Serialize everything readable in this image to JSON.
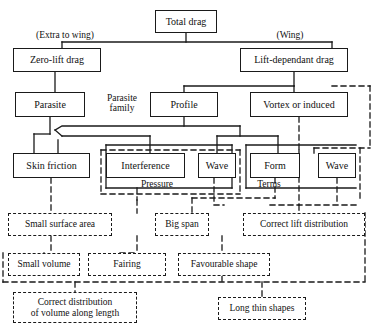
{
  "diagram": {
    "stroke_color": "#1a1a1a",
    "background": "#ffffff",
    "nodes": [
      {
        "id": "total_drag",
        "label": "Total drag",
        "style": "solid",
        "x": 155,
        "y": 10,
        "w": 62,
        "h": 23,
        "fs": 10
      },
      {
        "id": "zero_lift",
        "label": "Zero-lift drag",
        "style": "solid",
        "x": 13,
        "y": 48,
        "w": 88,
        "h": 24,
        "fs": 10
      },
      {
        "id": "lift_dep",
        "label": "Lift-dependant drag",
        "style": "solid",
        "x": 240,
        "y": 48,
        "w": 108,
        "h": 24,
        "fs": 10
      },
      {
        "id": "parasite",
        "label": "Parasite",
        "style": "solid",
        "x": 15,
        "y": 92,
        "w": 70,
        "h": 25,
        "fs": 10
      },
      {
        "id": "profile",
        "label": "Profile",
        "style": "solid",
        "x": 150,
        "y": 92,
        "w": 68,
        "h": 25,
        "fs": 10
      },
      {
        "id": "vortex",
        "label": "Vortex or induced",
        "style": "solid",
        "x": 250,
        "y": 92,
        "w": 98,
        "h": 25,
        "fs": 10
      },
      {
        "id": "skin_friction",
        "label": "Skin friction",
        "style": "solid",
        "x": 13,
        "y": 153,
        "w": 77,
        "h": 25,
        "fs": 10
      },
      {
        "id": "interference",
        "label": "Interference",
        "style": "solid",
        "x": 106,
        "y": 153,
        "w": 79,
        "h": 25,
        "fs": 10
      },
      {
        "id": "wave_left",
        "label": "Wave",
        "style": "solid",
        "x": 198,
        "y": 153,
        "w": 38,
        "h": 25,
        "fs": 10
      },
      {
        "id": "form",
        "label": "Form",
        "style": "solid",
        "x": 250,
        "y": 153,
        "w": 50,
        "h": 25,
        "fs": 10
      },
      {
        "id": "wave_right",
        "label": "Wave",
        "style": "solid",
        "x": 318,
        "y": 153,
        "w": 38,
        "h": 25,
        "fs": 10
      },
      {
        "id": "small_surf",
        "label": "Small surface area",
        "style": "dashed",
        "x": 8,
        "y": 213,
        "w": 104,
        "h": 23,
        "fs": 9.5
      },
      {
        "id": "big_span",
        "label": "Big span",
        "style": "dashed",
        "x": 155,
        "y": 213,
        "w": 54,
        "h": 23,
        "fs": 9.5
      },
      {
        "id": "corr_lift",
        "label": "Correct lift distribution",
        "style": "dashed",
        "x": 243,
        "y": 213,
        "w": 122,
        "h": 23,
        "fs": 9.5
      },
      {
        "id": "small_vol",
        "label": "Small volume",
        "style": "dashed",
        "x": 8,
        "y": 253,
        "w": 72,
        "h": 23,
        "fs": 9.5
      },
      {
        "id": "fairing",
        "label": "Fairing",
        "style": "dashed",
        "x": 88,
        "y": 253,
        "w": 78,
        "h": 23,
        "fs": 9.5
      },
      {
        "id": "fav_shape",
        "label": "Favourable shape",
        "style": "dashed",
        "x": 178,
        "y": 253,
        "w": 92,
        "h": 23,
        "fs": 9.5
      },
      {
        "id": "corr_dist",
        "label": "Correct distribution\nof volume along length",
        "style": "dashed",
        "x": 13,
        "y": 292,
        "w": 124,
        "h": 31,
        "fs": 9.5
      },
      {
        "id": "long_thin",
        "label": "Long thin shapes",
        "style": "dashed",
        "x": 218,
        "y": 297,
        "w": 88,
        "h": 23,
        "fs": 9.5
      }
    ],
    "annotations": [
      {
        "id": "extra_to_wing",
        "text": "(Extra to wing)",
        "x": 21,
        "y": 30,
        "w": 88,
        "fs": 9.5
      },
      {
        "id": "wing",
        "text": "(Wing)",
        "x": 268,
        "y": 30,
        "w": 44,
        "fs": 9.5
      },
      {
        "id": "parasite_family",
        "text": "Parasite\nfamily",
        "x": 98,
        "y": 93,
        "w": 48,
        "fs": 9.5
      },
      {
        "id": "pressure",
        "text": "Pressure",
        "x": 133,
        "y": 179,
        "w": 48,
        "fs": 9.5
      },
      {
        "id": "terms",
        "text": "Terms",
        "x": 249,
        "y": 179,
        "w": 40,
        "fs": 9.5
      }
    ]
  }
}
